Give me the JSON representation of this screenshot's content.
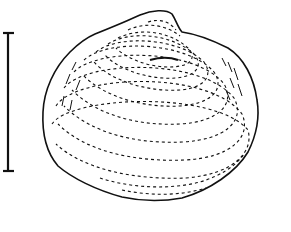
{
  "figure": {
    "view": "lateral",
    "colors": {
      "background": "#ffffff",
      "ink": "#111111"
    },
    "scale_bar": {
      "orientation": "vertical",
      "x": 8,
      "y_top": 33,
      "y_bottom": 171
    },
    "labels": []
  }
}
